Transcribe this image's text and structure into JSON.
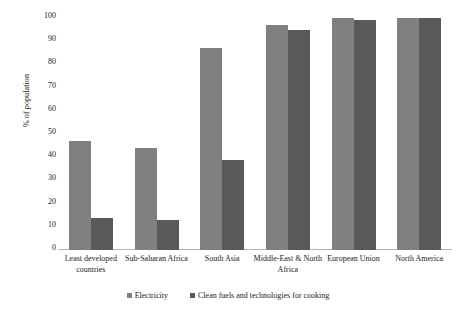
{
  "chart_data": {
    "type": "bar",
    "title": "",
    "xlabel": "",
    "ylabel": "% of population",
    "ylim": [
      0,
      100
    ],
    "ytick_step": 10,
    "yticks": [
      100,
      90,
      80,
      70,
      60,
      50,
      40,
      30,
      20,
      10,
      0
    ],
    "grid": false,
    "legend_position": "bottom",
    "categories": [
      "Least developed countries",
      "Sub-Saharan Africa",
      "South Asia",
      "Middle-East & North Africa",
      "European Union",
      "North America"
    ],
    "series": [
      {
        "name": "Electricity",
        "color": "#808080",
        "values": [
          47,
          44,
          87,
          97,
          100,
          100
        ]
      },
      {
        "name": "Clean fuels and technologies for cooking",
        "color": "#595959",
        "values": [
          14,
          13,
          39,
          95,
          99,
          100
        ]
      }
    ]
  },
  "axis": {
    "y_title": "% of population"
  },
  "colors": {
    "series_1": "#808080",
    "series_2": "#595959",
    "axis_line": "#b5b5b5",
    "text": "#1a1a1a",
    "background": "#ffffff"
  }
}
